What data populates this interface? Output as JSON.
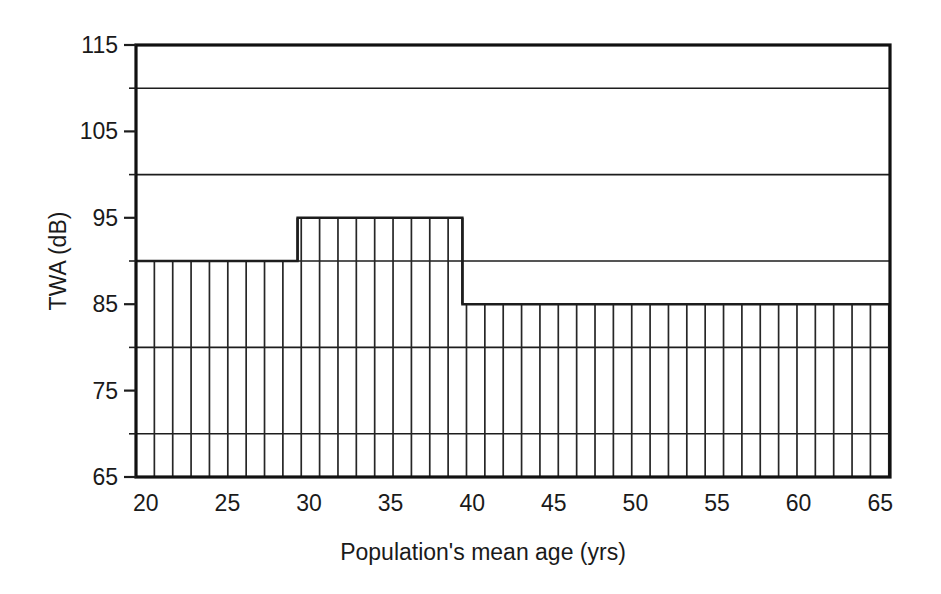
{
  "chart_data": {
    "type": "bar",
    "title": "",
    "subtitle": "",
    "xlabel": "Population's mean age (yrs)",
    "ylabel": "TWA (dB)",
    "xlim": [
      19.4,
      65.6
    ],
    "ylim": [
      65,
      115
    ],
    "xticks": [
      20,
      25,
      30,
      35,
      40,
      45,
      50,
      55,
      60,
      65
    ],
    "xtick_labels": [
      "20",
      "25",
      "30",
      "35",
      "40",
      "45",
      "50",
      "55",
      "60",
      "65"
    ],
    "yticks": [
      65,
      75,
      85,
      95,
      105,
      115
    ],
    "ytick_labels": [
      "65",
      "75",
      "85",
      "95",
      "105",
      "115"
    ],
    "yticks_minor": [
      70,
      80,
      90,
      100,
      110
    ],
    "gridlines_y": [
      70,
      80,
      90,
      100,
      110
    ],
    "grid": true,
    "legend": null,
    "legend_position": "none",
    "fill_pattern": "vertical-hatch",
    "hatch_spacing_years": 1.125,
    "categories": [
      "20-29.3",
      "29.3-39.4",
      "39.4-65.6"
    ],
    "values": [
      90,
      95,
      85
    ],
    "steps": [
      {
        "x_start": 19.4,
        "x_end": 29.3,
        "twa": 90
      },
      {
        "x_start": 29.3,
        "x_end": 39.4,
        "twa": 95
      },
      {
        "x_start": 39.4,
        "x_end": 65.6,
        "twa": 85
      }
    ],
    "colors": {
      "axis": "#111111",
      "grid": "#1d1d1d",
      "bar_outline": "#1d1d1d",
      "hatch": "#262626",
      "background": "#ffffff"
    }
  },
  "figure": {
    "background_color": "#ffffff"
  }
}
